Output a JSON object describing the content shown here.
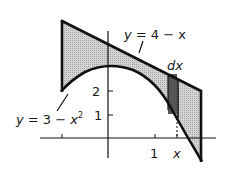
{
  "figure": {
    "type": "area-between-curves",
    "curves": [
      {
        "name": "line",
        "label": "y = 4 − x"
      },
      {
        "name": "parabola",
        "label": "y = 3 − x²"
      }
    ],
    "strip_label": "dx",
    "axis_labels": {
      "y_ticks": [
        "2",
        "1"
      ],
      "x_ticks": [
        "1",
        "x"
      ]
    },
    "colors": {
      "region_fill": "#c8c8c8",
      "strip_fill": "#5a5a5a",
      "stroke": "#111111"
    }
  },
  "labels": {
    "line_eq_y": "y",
    "line_eq_rest": " = 4 − x",
    "parabola_eq_y": "y",
    "parabola_eq_mid": " = 3 − ",
    "parabola_eq_x": "x",
    "parabola_eq_exp": "2",
    "dx": "dx",
    "ytick_2": "2",
    "ytick_1": "1",
    "xtick_1": "1",
    "xtick_x": "x"
  }
}
